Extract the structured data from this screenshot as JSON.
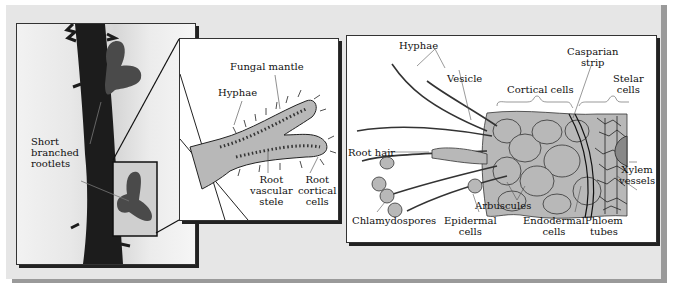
{
  "figure": {
    "photo_panel": {
      "label": [
        "Short",
        "branched",
        "rootlets"
      ]
    },
    "ectomycorrhiza_drawing": {
      "labels": {
        "fungal_mantle": "Fungal mantle",
        "hyphae": "Hyphae",
        "root_vascular_stele": [
          "Root",
          "vascular",
          "stele"
        ],
        "root_cortical_cells": [
          "Root",
          "cortical",
          "cells"
        ]
      }
    },
    "endomycorrhiza_drawing": {
      "labels": {
        "hyphae": "Hyphae",
        "vesicle": "Vesicle",
        "cortical_cells": "Cortical cells",
        "casparian_strip": [
          "Casparian",
          "strip"
        ],
        "stelar_cells": [
          "Stelar",
          "cells"
        ],
        "root_hair": "Root hair",
        "xylem_vessels": [
          "Xylem",
          "vessels"
        ],
        "chlamydospores": "Chlamydospores",
        "arbuscules": "Arbuscules",
        "epidermal_cells": [
          "Epidermal",
          "cells"
        ],
        "endodermal_cells": [
          "Endodermal",
          "cells"
        ],
        "phloem_tubes": [
          "Phloem",
          "tubes"
        ]
      }
    },
    "colors": {
      "panel_background": "#e6e6e6",
      "tissue_fill": "#b8b8b8",
      "outline": "#222222"
    }
  }
}
